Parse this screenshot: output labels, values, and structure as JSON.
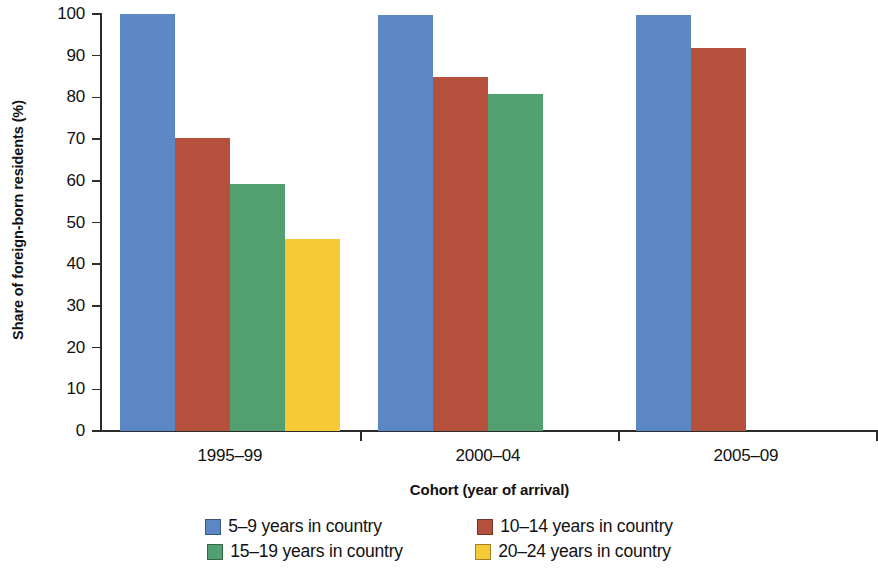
{
  "chart_data": {
    "type": "bar",
    "title": "",
    "xlabel": "Cohort (year of arrival)",
    "ylabel": "Share of foreign-born residents (%)",
    "categories": [
      "1995–99",
      "2000–04",
      "2005–09"
    ],
    "series": [
      {
        "name": "5–9 years in country",
        "color": "#5b87c4",
        "values": [
          100,
          99.8,
          99.7
        ]
      },
      {
        "name": "10–14 years in country",
        "color": "#b4503c",
        "values": [
          70.3,
          85.0,
          91.8
        ]
      },
      {
        "name": "15–19 years in country",
        "color": "#52a070",
        "values": [
          59.2,
          80.7,
          null
        ]
      },
      {
        "name": "20–24 years in country",
        "color": "#f6c937",
        "values": [
          46.1,
          null,
          null
        ]
      }
    ],
    "ylim": [
      0,
      100
    ],
    "yticks": [
      0,
      10,
      20,
      30,
      40,
      50,
      60,
      70,
      80,
      90,
      100
    ],
    "ytick_labels": [
      "0",
      "10",
      "20",
      "30",
      "40",
      "50",
      "60",
      "70",
      "80",
      "90",
      "100"
    ],
    "grid": false,
    "legend_position": "bottom",
    "axis_color": "#2b2b2b"
  },
  "legend": {
    "rows": [
      [
        {
          "label": "5–9 years in country",
          "color": "#5b87c4"
        },
        {
          "label": "10–14 years in country",
          "color": "#b4503c"
        }
      ],
      [
        {
          "label": "15–19 years in country",
          "color": "#52a070"
        },
        {
          "label": "20–24 years in country",
          "color": "#f6c937"
        }
      ]
    ]
  }
}
